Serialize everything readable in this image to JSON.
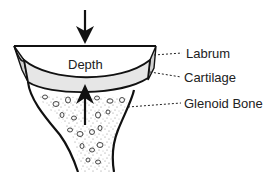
{
  "diagram": {
    "depth_label": "Depth",
    "labels": [
      {
        "text": "Labrum"
      },
      {
        "text": "Cartilage"
      },
      {
        "text": "Glenoid Bone"
      }
    ],
    "colors": {
      "outline": "#111111",
      "labrum_fill": "#d0d0d0",
      "cartilage_fill": "#e6e6e6",
      "bone_stipple": "#555555"
    }
  }
}
